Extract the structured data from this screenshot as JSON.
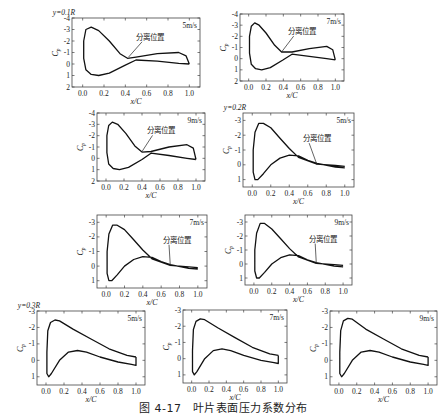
{
  "caption": "图 4-17　叶片表面压力系数分布",
  "chart_data": [
    {
      "type": "line",
      "group_label": "y=0.1R",
      "speed": "5m/s",
      "annotation": "分离位置",
      "xlabel": "x/C",
      "ylabel": "Cp",
      "xlim": [
        -0.1,
        1.1
      ],
      "ylim": [
        2,
        -4
      ],
      "xticks": [
        "0.0",
        "0.2",
        "0.4",
        "0.6",
        "0.8",
        "1.0"
      ],
      "yticks": [
        "-4",
        "-3",
        "-2",
        "-1",
        "0",
        "1",
        "2"
      ],
      "box": [
        72,
        18,
        200,
        87
      ],
      "upper": [
        [
          1.0,
          0
        ],
        [
          0.97,
          -0.7
        ],
        [
          0.9,
          -1.0
        ],
        [
          0.7,
          -0.9
        ],
        [
          0.5,
          -0.6
        ],
        [
          0.42,
          -0.5
        ],
        [
          0.35,
          -0.9
        ],
        [
          0.25,
          -2.0
        ],
        [
          0.15,
          -2.9
        ],
        [
          0.08,
          -3.2
        ],
        [
          0.03,
          -3.0
        ],
        [
          0.01,
          -2.0
        ],
        [
          0.01,
          -0.5
        ]
      ],
      "lower": [
        [
          0.01,
          -0.5
        ],
        [
          0.03,
          0.5
        ],
        [
          0.08,
          0.9
        ],
        [
          0.15,
          1.0
        ],
        [
          0.25,
          0.8
        ],
        [
          0.4,
          0.1
        ],
        [
          0.5,
          -0.35
        ],
        [
          0.7,
          -0.25
        ],
        [
          0.9,
          -0.05
        ],
        [
          1.0,
          0
        ]
      ],
      "sep_point": [
        0.43,
        -0.6
      ],
      "label_pos": [
        0.5,
        -2.1
      ]
    },
    {
      "type": "line",
      "group_label": "",
      "speed": "7m/s",
      "annotation": "分离位置",
      "xlabel": "x/C",
      "ylabel": "Cp",
      "xlim": [
        -0.1,
        1.1
      ],
      "ylim": [
        2,
        -4
      ],
      "xticks": [
        "0.0",
        "0.2",
        "0.4",
        "0.6",
        "0.8",
        "1.0"
      ],
      "yticks": [
        "-4",
        "-3",
        "-2",
        "-1",
        "0",
        "1",
        "2"
      ],
      "box": [
        240,
        14,
        344,
        81
      ],
      "upper": [
        [
          1.0,
          0.1
        ],
        [
          0.97,
          -0.8
        ],
        [
          0.9,
          -1.1
        ],
        [
          0.7,
          -0.9
        ],
        [
          0.5,
          -0.6
        ],
        [
          0.38,
          -0.6
        ],
        [
          0.3,
          -1.2
        ],
        [
          0.2,
          -2.3
        ],
        [
          0.12,
          -3.0
        ],
        [
          0.07,
          -3.2
        ],
        [
          0.03,
          -2.9
        ],
        [
          0.01,
          -2.0
        ],
        [
          0.01,
          -0.5
        ]
      ],
      "lower": [
        [
          0.01,
          -0.5
        ],
        [
          0.03,
          0.5
        ],
        [
          0.08,
          0.9
        ],
        [
          0.15,
          1.0
        ],
        [
          0.25,
          0.8
        ],
        [
          0.4,
          0.1
        ],
        [
          0.5,
          -0.4
        ],
        [
          0.7,
          -0.2
        ],
        [
          0.9,
          0.0
        ],
        [
          1.0,
          0.1
        ]
      ],
      "sep_point": [
        0.38,
        -0.6
      ],
      "label_pos": [
        0.45,
        -2.2
      ]
    },
    {
      "type": "line",
      "group_label": "",
      "speed": "9m/s",
      "annotation": "分离位置",
      "xlabel": "x/C",
      "ylabel": "Cp",
      "xlim": [
        -0.1,
        1.1
      ],
      "ylim": [
        2,
        -4
      ],
      "xticks": [
        "0.0",
        "0.2",
        "0.4",
        "0.6",
        "0.8",
        "1.0"
      ],
      "yticks": [
        "-4",
        "-3",
        "-2",
        "-1",
        "0",
        "1",
        "2"
      ],
      "box": [
        97,
        113,
        205,
        181
      ],
      "upper": [
        [
          1.0,
          0.1
        ],
        [
          0.97,
          -0.9
        ],
        [
          0.9,
          -1.2
        ],
        [
          0.7,
          -1.0
        ],
        [
          0.5,
          -0.6
        ],
        [
          0.4,
          -0.55
        ],
        [
          0.32,
          -1.1
        ],
        [
          0.22,
          -2.2
        ],
        [
          0.13,
          -3.0
        ],
        [
          0.07,
          -3.2
        ],
        [
          0.03,
          -2.9
        ],
        [
          0.01,
          -2.0
        ],
        [
          0.01,
          -0.5
        ]
      ],
      "lower": [
        [
          0.01,
          -0.5
        ],
        [
          0.03,
          0.5
        ],
        [
          0.08,
          0.9
        ],
        [
          0.15,
          1.0
        ],
        [
          0.25,
          0.8
        ],
        [
          0.4,
          0.1
        ],
        [
          0.5,
          -0.45
        ],
        [
          0.7,
          -0.25
        ],
        [
          0.9,
          0.0
        ],
        [
          1.0,
          0.1
        ]
      ],
      "sep_point": [
        0.4,
        -0.6
      ],
      "label_pos": [
        0.45,
        -2.2
      ]
    },
    {
      "type": "line",
      "group_label": "y=0.2R",
      "speed": "5m/s",
      "annotation": "分离位置",
      "xlabel": "x/C",
      "ylabel": "Cp",
      "xlim": [
        -0.1,
        1.1
      ],
      "ylim": [
        1.5,
        -3.5
      ],
      "xticks": [
        "0.0",
        "0.2",
        "0.4",
        "0.6",
        "0.8",
        "1.0"
      ],
      "yticks": [
        "-3",
        "-2",
        "-1",
        "0",
        "1"
      ],
      "box": [
        243,
        113,
        354,
        187
      ],
      "upper": [
        [
          1.0,
          0.1
        ],
        [
          0.9,
          0.05
        ],
        [
          0.7,
          -0.05
        ],
        [
          0.5,
          -0.5
        ],
        [
          0.4,
          -1.1
        ],
        [
          0.3,
          -1.8
        ],
        [
          0.2,
          -2.5
        ],
        [
          0.12,
          -2.8
        ],
        [
          0.07,
          -2.8
        ],
        [
          0.03,
          -2.2
        ],
        [
          0.01,
          -1.0
        ],
        [
          0.01,
          0.5
        ]
      ],
      "lower": [
        [
          0.01,
          0.5
        ],
        [
          0.03,
          1.0
        ],
        [
          0.06,
          1.0
        ],
        [
          0.12,
          0.6
        ],
        [
          0.2,
          0.0
        ],
        [
          0.3,
          -0.45
        ],
        [
          0.4,
          -0.65
        ],
        [
          0.5,
          -0.6
        ],
        [
          0.6,
          -0.3
        ],
        [
          0.7,
          -0.1
        ],
        [
          0.9,
          0.15
        ],
        [
          1.0,
          0.2
        ]
      ],
      "sep_point": [
        0.7,
        0.0
      ],
      "label_pos": [
        0.55,
        -1.6
      ]
    },
    {
      "type": "line",
      "group_label": "",
      "speed": "7m/s",
      "annotation": "分离位置",
      "xlabel": "x/C",
      "ylabel": "Cp",
      "xlim": [
        -0.1,
        1.1
      ],
      "ylim": [
        1.5,
        -3.5
      ],
      "xticks": [
        "0.0",
        "0.2",
        "0.4",
        "0.6",
        "0.8",
        "1.0"
      ],
      "yticks": [
        "-3",
        "-2",
        "-1",
        "0",
        "1"
      ],
      "box": [
        97,
        215,
        207,
        288
      ],
      "upper": [
        [
          1.0,
          0.1
        ],
        [
          0.9,
          0.05
        ],
        [
          0.7,
          -0.05
        ],
        [
          0.5,
          -0.5
        ],
        [
          0.4,
          -1.1
        ],
        [
          0.3,
          -1.8
        ],
        [
          0.2,
          -2.5
        ],
        [
          0.12,
          -2.8
        ],
        [
          0.07,
          -2.8
        ],
        [
          0.03,
          -2.2
        ],
        [
          0.01,
          -1.0
        ],
        [
          0.01,
          0.5
        ]
      ],
      "lower": [
        [
          0.01,
          0.5
        ],
        [
          0.03,
          1.0
        ],
        [
          0.06,
          1.0
        ],
        [
          0.12,
          0.6
        ],
        [
          0.2,
          0.0
        ],
        [
          0.3,
          -0.45
        ],
        [
          0.4,
          -0.65
        ],
        [
          0.5,
          -0.6
        ],
        [
          0.6,
          -0.3
        ],
        [
          0.7,
          -0.1
        ],
        [
          0.9,
          0.15
        ],
        [
          1.0,
          0.2
        ]
      ],
      "sep_point": [
        0.7,
        0.0
      ],
      "label_pos": [
        0.62,
        -1.6
      ]
    },
    {
      "type": "line",
      "group_label": "",
      "speed": "9m/s",
      "annotation": "分离位置",
      "xlabel": "x/C",
      "ylabel": "Cp",
      "xlim": [
        -0.1,
        1.1
      ],
      "ylim": [
        1.5,
        -3.5
      ],
      "xticks": [
        "0.0",
        "0.2",
        "0.4",
        "0.6",
        "0.8",
        "1.0"
      ],
      "yticks": [
        "-3",
        "-2",
        "-1",
        "0",
        "1"
      ],
      "box": [
        245,
        215,
        352,
        285
      ],
      "upper": [
        [
          1.0,
          0.1
        ],
        [
          0.9,
          0.05
        ],
        [
          0.7,
          -0.05
        ],
        [
          0.5,
          -0.5
        ],
        [
          0.4,
          -1.1
        ],
        [
          0.3,
          -1.8
        ],
        [
          0.2,
          -2.5
        ],
        [
          0.12,
          -2.9
        ],
        [
          0.07,
          -2.9
        ],
        [
          0.03,
          -2.2
        ],
        [
          0.01,
          -1.0
        ],
        [
          0.01,
          0.5
        ]
      ],
      "lower": [
        [
          0.01,
          0.5
        ],
        [
          0.03,
          1.0
        ],
        [
          0.06,
          1.0
        ],
        [
          0.12,
          0.6
        ],
        [
          0.2,
          0.0
        ],
        [
          0.3,
          -0.45
        ],
        [
          0.4,
          -0.65
        ],
        [
          0.5,
          -0.6
        ],
        [
          0.6,
          -0.3
        ],
        [
          0.7,
          -0.1
        ],
        [
          0.9,
          0.15
        ],
        [
          1.0,
          0.2
        ]
      ],
      "sep_point": [
        0.7,
        0.0
      ],
      "label_pos": [
        0.62,
        -1.6
      ]
    },
    {
      "type": "line",
      "group_label": "y=0.3R",
      "speed": "5m/s",
      "annotation": "",
      "xlabel": "x/C",
      "ylabel": "Cp",
      "xlim": [
        -0.1,
        1.1
      ],
      "ylim": [
        1.5,
        -3
      ],
      "xticks": [
        "0.0",
        "0.2",
        "0.4",
        "0.6",
        "0.8",
        "1.0"
      ],
      "yticks": [
        "-3",
        "-2",
        "-1",
        "0",
        "1"
      ],
      "box": [
        37,
        311,
        145,
        385
      ],
      "upper": [
        [
          1.0,
          -0.2
        ],
        [
          0.9,
          -0.3
        ],
        [
          0.7,
          -0.7
        ],
        [
          0.5,
          -1.3
        ],
        [
          0.3,
          -1.9
        ],
        [
          0.15,
          -2.4
        ],
        [
          0.1,
          -2.45
        ],
        [
          0.05,
          -2.3
        ],
        [
          0.02,
          -1.8
        ],
        [
          0.01,
          -0.5
        ],
        [
          0.01,
          0.8
        ]
      ],
      "lower": [
        [
          0.01,
          0.8
        ],
        [
          0.03,
          1.0
        ],
        [
          0.06,
          0.8
        ],
        [
          0.15,
          0.0
        ],
        [
          0.25,
          -0.5
        ],
        [
          0.35,
          -0.6
        ],
        [
          0.45,
          -0.5
        ],
        [
          0.6,
          -0.2
        ],
        [
          0.8,
          0.1
        ],
        [
          0.95,
          0.25
        ],
        [
          1.0,
          0.3
        ],
        [
          1.0,
          -0.2
        ]
      ],
      "sep_point": null,
      "label_pos": null
    },
    {
      "type": "line",
      "group_label": "",
      "speed": "7m/s",
      "annotation": "",
      "xlabel": "x/C",
      "ylabel": "Cp",
      "xlim": [
        -0.1,
        1.1
      ],
      "ylim": [
        1.5,
        -3
      ],
      "xticks": [
        "0.0",
        "0.2",
        "0.4",
        "0.6",
        "0.8",
        "1.0"
      ],
      "yticks": [
        "-3",
        "-2",
        "-1",
        "0",
        "1"
      ],
      "box": [
        183,
        310,
        287,
        383
      ],
      "upper": [
        [
          1.0,
          -0.2
        ],
        [
          0.9,
          -0.3
        ],
        [
          0.7,
          -0.7
        ],
        [
          0.5,
          -1.3
        ],
        [
          0.3,
          -1.9
        ],
        [
          0.15,
          -2.4
        ],
        [
          0.1,
          -2.45
        ],
        [
          0.05,
          -2.3
        ],
        [
          0.02,
          -1.8
        ],
        [
          0.01,
          -0.5
        ],
        [
          0.01,
          0.8
        ]
      ],
      "lower": [
        [
          0.01,
          0.8
        ],
        [
          0.03,
          1.0
        ],
        [
          0.06,
          0.8
        ],
        [
          0.15,
          0.0
        ],
        [
          0.25,
          -0.5
        ],
        [
          0.35,
          -0.6
        ],
        [
          0.45,
          -0.5
        ],
        [
          0.6,
          -0.2
        ],
        [
          0.8,
          0.1
        ],
        [
          0.95,
          0.25
        ],
        [
          1.0,
          0.3
        ],
        [
          1.0,
          -0.2
        ]
      ],
      "sep_point": null,
      "label_pos": null
    },
    {
      "type": "line",
      "group_label": "",
      "speed": "9m/s",
      "annotation": "",
      "xlabel": "x/C",
      "ylabel": "Cp",
      "xlim": [
        -0.1,
        1.1
      ],
      "ylim": [
        1.5,
        -3
      ],
      "xticks": [
        "0.0",
        "0.2",
        "0.4",
        "0.6",
        "0.8",
        "1.0"
      ],
      "yticks": [
        "-3",
        "-2",
        "-1",
        "0",
        "1"
      ],
      "box": [
        330,
        311,
        437,
        385
      ],
      "upper": [
        [
          1.0,
          -0.2
        ],
        [
          0.9,
          -0.3
        ],
        [
          0.7,
          -0.7
        ],
        [
          0.5,
          -1.3
        ],
        [
          0.3,
          -1.9
        ],
        [
          0.15,
          -2.5
        ],
        [
          0.1,
          -2.55
        ],
        [
          0.05,
          -2.4
        ],
        [
          0.02,
          -1.8
        ],
        [
          0.01,
          -0.5
        ],
        [
          0.01,
          0.8
        ]
      ],
      "lower": [
        [
          0.01,
          0.8
        ],
        [
          0.03,
          1.0
        ],
        [
          0.06,
          0.8
        ],
        [
          0.15,
          0.0
        ],
        [
          0.25,
          -0.5
        ],
        [
          0.35,
          -0.6
        ],
        [
          0.45,
          -0.5
        ],
        [
          0.6,
          -0.2
        ],
        [
          0.8,
          0.1
        ],
        [
          0.95,
          0.25
        ],
        [
          1.0,
          0.3
        ],
        [
          1.0,
          -0.2
        ]
      ],
      "sep_point": null,
      "label_pos": null
    }
  ]
}
